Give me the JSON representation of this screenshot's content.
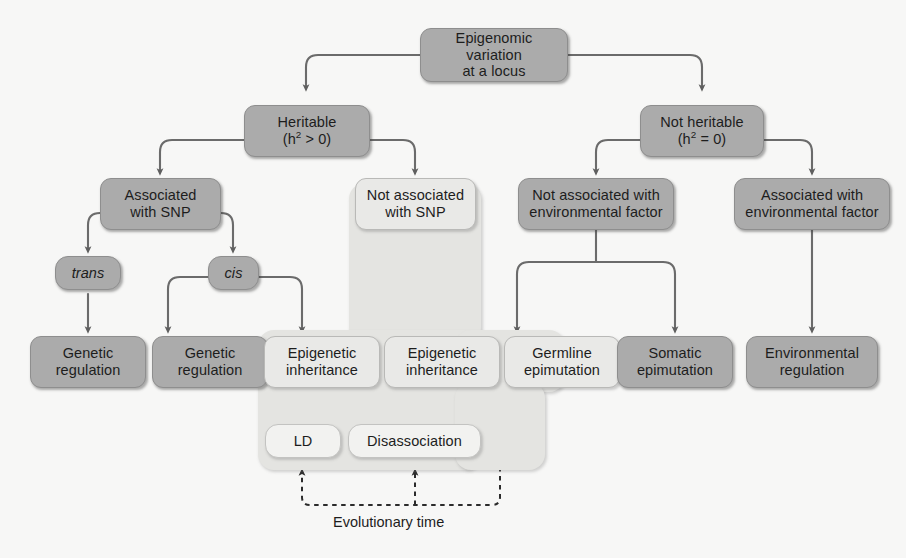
{
  "figure": {
    "type": "flowchart",
    "background_color": "#f7f7f6",
    "node_fill": "#ababab",
    "node_light_fill": "#e9e9e7",
    "region_fill": "#e4e4e1",
    "edge_color": "#6b6b6b",
    "text_color": "#1d1d1d",
    "caption": "Evolutionary time"
  },
  "nodes": {
    "root": {
      "line1": "Epigenomic variation",
      "line2": "at a locus"
    },
    "heritable": {
      "line1": "Heritable",
      "line2_pre": "(h",
      "line2_sup": "2",
      "line2_post": " > 0)"
    },
    "not_heritable": {
      "line1": "Not heritable",
      "line2_pre": "(h",
      "line2_sup": "2",
      "line2_post": " = 0)"
    },
    "assoc_snp": {
      "line1": "Associated",
      "line2": "with SNP"
    },
    "not_assoc_snp": {
      "line1": "Not associated",
      "line2": "with SNP"
    },
    "not_assoc_env": {
      "line1": "Not associated with",
      "line2": "environmental factor"
    },
    "assoc_env": {
      "line1": "Associated with",
      "line2": "environmental factor"
    },
    "trans": {
      "label": "trans"
    },
    "cis": {
      "label": "cis"
    },
    "genetic_reg_trans": {
      "line1": "Genetic",
      "line2": "regulation"
    },
    "genetic_reg_cis": {
      "line1": "Genetic",
      "line2": "regulation"
    },
    "epi_inherit_cis": {
      "line1": "Epigenetic",
      "line2": "inheritance"
    },
    "epi_inherit_nosnp": {
      "line1": "Epigenetic",
      "line2": "inheritance"
    },
    "germline_epi": {
      "line1": "Germline",
      "line2": "epimutation"
    },
    "somatic_epi": {
      "line1": "Somatic",
      "line2": "epimutation"
    },
    "env_reg": {
      "line1": "Environmental",
      "line2": "regulation"
    },
    "ld": {
      "label": "LD"
    },
    "disassociation": {
      "label": "Disassociation"
    }
  }
}
